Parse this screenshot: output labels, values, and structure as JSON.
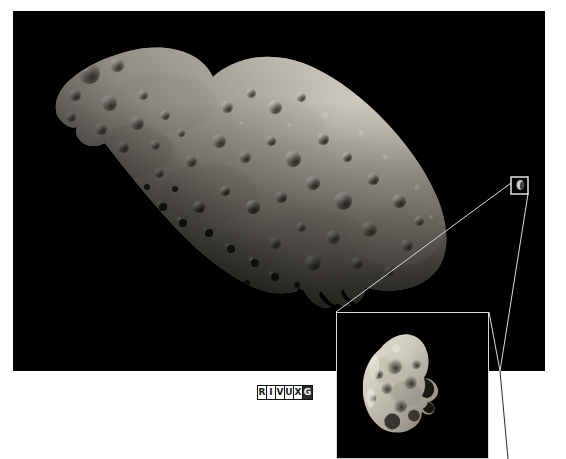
{
  "figure": {
    "background_color": "#ffffff",
    "plate_color": "#000000"
  },
  "main_photo": {
    "name": "asteroid Ida",
    "alt_text": "Elongated heavily cratered asteroid Ida photographed against black space",
    "lighting": "illuminated from upper left",
    "surface": "densely cratered regolith",
    "bounds": {
      "x": 13,
      "y": 11,
      "width": 532,
      "height": 360
    }
  },
  "source_box": {
    "name": "dactyl-source-box",
    "description": "small white square on the main photo marking the moon Dactyl",
    "bounds": {
      "x": 511,
      "y": 177,
      "width": 17,
      "height": 17
    }
  },
  "inset": {
    "name": "dactyl-magnified-inset",
    "alt_text": "Magnified view of Dactyl, the small crescent-lit moon of Ida",
    "bounds": {
      "x": 336,
      "y": 312,
      "width": 153,
      "height": 147
    },
    "border_color": "#d8d8d8"
  },
  "leader_lines": {
    "name": "callout-leader-lines",
    "color": "#dcdcdc",
    "count": 2
  },
  "wavelength_band": {
    "name": "RIVUXG wavelength indicator",
    "letters": [
      {
        "letter": "R",
        "band": "Radio",
        "active": false
      },
      {
        "letter": "I",
        "band": "Infrared",
        "active": false
      },
      {
        "letter": "V",
        "band": "Visible",
        "active": false
      },
      {
        "letter": "U",
        "band": "Ultraviolet",
        "active": false
      },
      {
        "letter": "X",
        "band": "X-ray",
        "active": false
      },
      {
        "letter": "G",
        "band": "Gamma ray",
        "active": true
      }
    ],
    "text": "RIVUXG",
    "bounds": {
      "x": 257,
      "y": 385,
      "width": 55,
      "height": 15
    }
  },
  "colors": {
    "space_black": "#000000",
    "page_white": "#ffffff",
    "line_gray": "#dcdcdc",
    "regolith_light": "#d7d2c8",
    "regolith_mid": "#9d978c",
    "regolith_dark": "#4a463f"
  }
}
